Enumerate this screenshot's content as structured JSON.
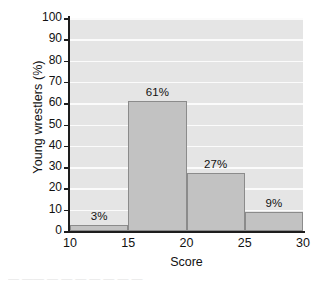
{
  "chart_data": {
    "type": "bar",
    "title": "",
    "xlabel": "Score",
    "ylabel": "Young wrestlers (%)",
    "categories": [
      "10-15",
      "15-20",
      "20-25",
      "25-30"
    ],
    "values": [
      3,
      61,
      27,
      9
    ],
    "bin_edges": [
      10,
      15,
      20,
      25,
      30
    ],
    "data_labels": [
      "3%",
      "61%",
      "27%",
      "9%"
    ],
    "xlim": [
      10,
      30
    ],
    "ylim": [
      0,
      100
    ],
    "xticks": [
      "10",
      "15",
      "20",
      "25",
      "30"
    ],
    "yticks": [
      "0",
      "10",
      "20",
      "30",
      "40",
      "50",
      "60",
      "70",
      "80",
      "90",
      "100"
    ],
    "grid": "horizontal-white",
    "legend": "none",
    "colors": {
      "bar_fill": "#c2c2c2",
      "bar_edge": "#8b8b8b",
      "plot_background": "#e5e5e5",
      "gridline": "#fbfbfb",
      "axis": "#1d1d1d",
      "text": "#111111"
    }
  },
  "caption": {
    "text": "— —— —  —  —   —  —   —  —"
  }
}
